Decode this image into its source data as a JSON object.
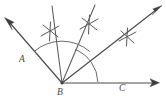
{
  "figure": {
    "type": "geometry-diagram",
    "background_color": "#ffffff",
    "line_color": "#4a4a4a",
    "arc_color": "#6a6a6a",
    "labels": {
      "a": "A",
      "b": "B",
      "c": "C"
    },
    "vertex": {
      "name": "B",
      "x": 62,
      "y": 83
    },
    "rays": [
      {
        "id": "ray-ba",
        "name": "ray-BA",
        "label": "A",
        "from": [
          62,
          83
        ],
        "to": [
          6,
          19
        ],
        "arrow": true
      },
      {
        "id": "ray-bisector-1",
        "name": "ray-first-bisector",
        "label": "",
        "from": [
          62,
          83
        ],
        "to": [
          52,
          6
        ],
        "arrow": false
      },
      {
        "id": "ray-bisector-2",
        "name": "ray-second-bisector",
        "label": "",
        "from": [
          62,
          83
        ],
        "to": [
          95,
          5
        ],
        "arrow": false
      },
      {
        "id": "ray-bisector-3",
        "name": "ray-third-bisector",
        "label": "",
        "from": [
          62,
          83
        ],
        "to": [
          161,
          6
        ],
        "arrow": true
      },
      {
        "id": "ray-bc",
        "name": "ray-BC",
        "label": "C",
        "from": [
          62,
          83
        ],
        "to": [
          159,
          83
        ],
        "arrow": true
      }
    ],
    "arcs": [
      {
        "id": "arc-outer",
        "name": "construction-arc-outer",
        "center": [
          62,
          83
        ],
        "radius": 42,
        "start_angle_deg": 49,
        "end_angle_deg": 131
      },
      {
        "id": "arc-inner",
        "name": "construction-arc-inner",
        "center": [
          62,
          83
        ],
        "radius": 36,
        "start_angle_deg": 2,
        "end_angle_deg": 68
      }
    ],
    "tick_marks": [
      {
        "id": "tick-1",
        "name": "construction-cross-left",
        "x": 50,
        "y": 31,
        "arms": 3
      },
      {
        "id": "tick-2",
        "name": "construction-cross-middle",
        "x": 89,
        "y": 24,
        "arms": 3
      },
      {
        "id": "tick-3",
        "name": "construction-cross-right",
        "x": 127,
        "y": 37,
        "arms": 3
      }
    ]
  }
}
